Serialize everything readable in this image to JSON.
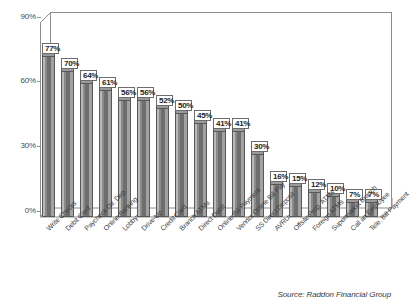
{
  "chart_data": {
    "type": "bar",
    "title": "",
    "subtitle": "",
    "xlabel": "",
    "ylabel": "",
    "ylim": [
      0,
      90
    ],
    "yticks": [
      "0%",
      "30%",
      "60%",
      "90%"
    ],
    "ytick_values": [
      0,
      30,
      60,
      90
    ],
    "grid": false,
    "legend": null,
    "orientation": "vertical",
    "style": "3d",
    "categories": [
      "Write Checks",
      "Debit Card",
      "Paycheck Dir. Dep.",
      "Online Banking",
      "Lobby",
      "Drive-Up",
      "Credit Card",
      "Branch ATMs",
      "Direct Debit",
      "Online Bill Payment",
      "Vendor Online Bill Pay",
      "SS Direct Deposit",
      "AVRU",
      "Offsite Prop. ATMs",
      "Foreign ATMs",
      "Supermarket Branch",
      "Call an Employee",
      "Tele. Bill Payment"
    ],
    "values": [
      77,
      70,
      64,
      61,
      56,
      56,
      52,
      50,
      45,
      41,
      41,
      30,
      16,
      15,
      12,
      10,
      7,
      7
    ],
    "data_labels": [
      "77%",
      "70%",
      "64%",
      "61%",
      "56%",
      "56%",
      "52%",
      "50%",
      "45%",
      "41%",
      "41%",
      "30%",
      "16%",
      "15%",
      "12%",
      "10%",
      "7%",
      "7%"
    ],
    "annotations": {
      "source": "Source: Raddon Financial Group"
    },
    "colors": {
      "bar_fill_dark": "#6e6e6e",
      "bar_fill_mid": "#8a8a8a",
      "bar_fill_light": "#b9b9b9",
      "bar_outline": "#585858",
      "axis": "#8d8d8d",
      "text": "#3a3a3a",
      "background": "#ffffff",
      "callout_background": "#ffffff",
      "callout_border": "#6d6d6d"
    }
  }
}
